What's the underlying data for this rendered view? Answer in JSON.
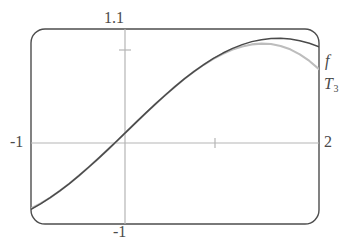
{
  "figure": {
    "kind": "function-plot",
    "frame": {
      "corner_radius": 14,
      "stroke": "#4d4d4d"
    },
    "axis_color": "#b3b3b3",
    "f_color": "#4a4a4a",
    "t3_color": "#bdbdbd"
  },
  "labels": {
    "y_max": "1.1",
    "y_min": "-1",
    "x_min": "-1",
    "x_max": "2",
    "curve_f": "f",
    "curve_t3_base": "T",
    "curve_t3_sub": "3"
  },
  "chart_data": {
    "type": "line",
    "title": "",
    "xlabel": "",
    "ylabel": "",
    "xlim": [
      -1,
      2
    ],
    "ylim": [
      -1,
      1.1
    ],
    "grid": false,
    "legend": "inline-right-edge",
    "axes": {
      "x_axis_at_y": 0,
      "y_axis_at_x": 0,
      "x_ticks": [
        1
      ],
      "y_ticks": [
        1
      ],
      "tick_labels_shown": [
        "-1",
        "2",
        "1.1",
        "-1"
      ]
    },
    "annotations": [
      {
        "text": "f",
        "x": 2.0,
        "y": 0.72,
        "note": "label of the function curve at right edge"
      },
      {
        "text": "T3",
        "x": 2.0,
        "y": 0.5,
        "note": "label of the degree-3 Taylor polynomial at right edge"
      }
    ],
    "series": [
      {
        "name": "f",
        "color": "#4a4a4a",
        "x": [
          -1.0,
          -0.9,
          -0.8,
          -0.7,
          -0.6,
          -0.5,
          -0.4,
          -0.3,
          -0.2,
          -0.1,
          0.0,
          0.1,
          0.2,
          0.3,
          0.4,
          0.5,
          0.6,
          0.7,
          0.8,
          0.9,
          1.0,
          1.1,
          1.2,
          1.3,
          1.4,
          1.5,
          1.6,
          1.7,
          1.8,
          1.9,
          2.0
        ],
        "y": [
          -0.841,
          -0.783,
          -0.717,
          -0.644,
          -0.565,
          -0.479,
          -0.389,
          -0.296,
          -0.199,
          -0.1,
          0.0,
          0.1,
          0.199,
          0.296,
          0.389,
          0.479,
          0.565,
          0.644,
          0.717,
          0.783,
          0.841,
          0.891,
          0.932,
          0.964,
          0.985,
          0.997,
          1.0,
          0.992,
          0.974,
          0.946,
          0.909
        ]
      },
      {
        "name": "T3",
        "color": "#bdbdbd",
        "x": [
          -1.0,
          -0.9,
          -0.8,
          -0.7,
          -0.6,
          -0.5,
          -0.4,
          -0.3,
          -0.2,
          -0.1,
          0.0,
          0.1,
          0.2,
          0.3,
          0.4,
          0.5,
          0.6,
          0.7,
          0.8,
          0.9,
          1.0,
          1.1,
          1.2,
          1.3,
          1.4,
          1.5,
          1.6,
          1.7,
          1.8,
          1.9,
          2.0
        ],
        "y": [
          -0.833,
          -0.778,
          -0.715,
          -0.643,
          -0.564,
          -0.479,
          -0.389,
          -0.296,
          -0.199,
          -0.1,
          0.0,
          0.1,
          0.199,
          0.296,
          0.389,
          0.479,
          0.564,
          0.643,
          0.715,
          0.778,
          0.833,
          0.878,
          0.912,
          0.934,
          0.943,
          0.938,
          0.917,
          0.881,
          0.827,
          0.756,
          0.667
        ]
      }
    ]
  }
}
